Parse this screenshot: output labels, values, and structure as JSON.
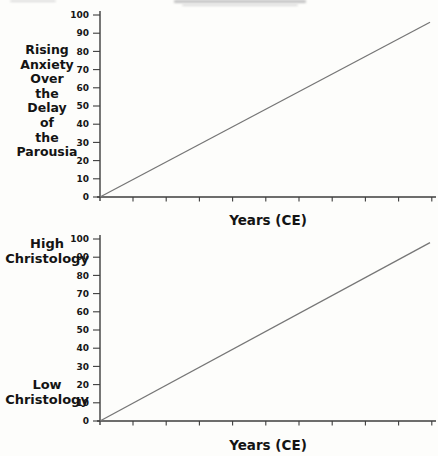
{
  "page": {
    "background": "#fdfdfb",
    "text_color": "#141414"
  },
  "chart_data": [
    {
      "type": "line",
      "ylabel": "Rising Anxiety Over the Delay of the Parousia",
      "ylabel_lines": [
        "Rising",
        "Anxiety",
        "Over",
        "the",
        "Delay",
        "of",
        "the",
        "Parousia"
      ],
      "xlabel": "Years (CE)",
      "ylim": [
        0,
        100
      ],
      "yticks": [
        100,
        90,
        80,
        70,
        60,
        50,
        40,
        30,
        20,
        10,
        0
      ],
      "xticks_unlabeled_count": 10,
      "xtick_labels_shown": false,
      "grid": false,
      "legend": false,
      "axis_color": "#3d3d3d",
      "line_color": "#767676",
      "series": [
        {
          "name": "rising-anxiety-trend",
          "points": [
            {
              "x": 0,
              "y": 0
            },
            {
              "x": 100,
              "y": 96
            }
          ]
        }
      ]
    },
    {
      "type": "line",
      "ylabel_top": "High Christology",
      "ylabel_bottom": "Low Christology",
      "ylabel_top_lines": [
        "High",
        "Christology"
      ],
      "ylabel_bottom_lines": [
        "Low",
        "Christology"
      ],
      "xlabel": "Years (CE)",
      "ylim": [
        0,
        100
      ],
      "yticks": [
        100,
        90,
        80,
        70,
        60,
        50,
        40,
        30,
        20,
        10,
        0
      ],
      "xticks_unlabeled_count": 10,
      "xtick_labels_shown": false,
      "grid": false,
      "legend": false,
      "axis_color": "#3d3d3d",
      "line_color": "#767676",
      "series": [
        {
          "name": "christology-trend",
          "points": [
            {
              "x": 0,
              "y": 0
            },
            {
              "x": 100,
              "y": 98
            }
          ]
        }
      ]
    }
  ]
}
